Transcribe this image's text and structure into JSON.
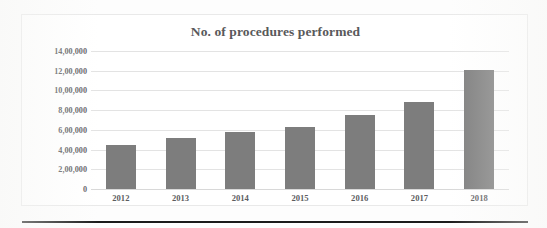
{
  "chart_data": {
    "type": "bar",
    "title": "No. of procedures performed",
    "xlabel": "",
    "ylabel": "",
    "categories": [
      "2012",
      "2013",
      "2014",
      "2015",
      "2016",
      "2017",
      "2018"
    ],
    "values": [
      450000,
      520000,
      575000,
      625000,
      755000,
      885000,
      1210000
    ],
    "ylim": [
      0,
      1400000
    ],
    "ytick_values": [
      0,
      200000,
      400000,
      600000,
      800000,
      1000000,
      1200000,
      1400000
    ],
    "ytick_labels": [
      "0",
      "2,00,000",
      "4,00,000",
      "6,00,000",
      "8,00,000",
      "10,00,000",
      "12,00,000",
      "14,00,000"
    ],
    "grid": true,
    "legend": false,
    "series": [
      {
        "name": "No. of procedures performed",
        "values": [
          450000,
          520000,
          575000,
          625000,
          755000,
          885000,
          1210000
        ],
        "color": "#7d7d7d"
      }
    ]
  },
  "colors": {
    "bar": "#7d7d7d",
    "gridline": "#e3e3e3",
    "text": "#5d5d5f",
    "title": "#59595b",
    "frame": "#e9e9e9",
    "rule": "#1b1b1b"
  }
}
